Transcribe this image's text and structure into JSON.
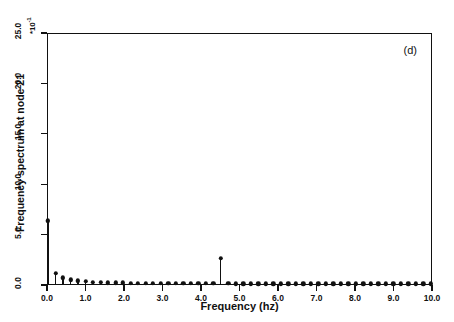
{
  "chart_data": {
    "type": "bar",
    "title": "",
    "panel_label": "(d)",
    "xlabel": "Frequency (hz)",
    "ylabel": "Frequency spectrum at node 21",
    "y_multiplier": "*10",
    "y_multiplier_exponent": "-1",
    "xlim": [
      0.0,
      10.0
    ],
    "ylim": [
      0.0,
      25.0
    ],
    "grid": false,
    "legend": null,
    "xticks": [
      "0.0",
      "1.0",
      "2.0",
      "3.0",
      "4.0",
      "5.0",
      "6.0",
      "7.0",
      "8.0",
      "9.0",
      "10.0"
    ],
    "xtick_values": [
      0.0,
      1.0,
      2.0,
      3.0,
      4.0,
      5.0,
      6.0,
      7.0,
      8.0,
      9.0,
      10.0
    ],
    "yticks": [
      "0.0",
      "5.0",
      "10.0",
      "15.0",
      "20.0",
      "25.0"
    ],
    "ytick_values": [
      0.0,
      5.0,
      10.0,
      15.0,
      20.0,
      25.0
    ],
    "x": [
      0.0,
      0.195,
      0.39,
      0.585,
      0.78,
      0.975,
      1.17,
      1.365,
      1.56,
      1.755,
      1.95,
      2.145,
      2.34,
      2.535,
      2.73,
      2.925,
      3.12,
      3.315,
      3.51,
      3.705,
      3.9,
      4.095,
      4.29,
      4.485,
      4.68,
      4.875,
      5.07,
      5.265,
      5.46,
      5.655,
      5.85,
      6.045,
      6.24,
      6.435,
      6.63,
      6.825,
      7.02,
      7.215,
      7.41,
      7.605,
      7.8,
      7.995,
      8.19,
      8.385,
      8.58,
      8.775,
      8.97,
      9.165,
      9.36,
      9.555,
      9.75,
      9.945
    ],
    "values": [
      6.3,
      1.05,
      0.62,
      0.44,
      0.33,
      0.25,
      0.2,
      0.17,
      0.15,
      0.13,
      0.12,
      0.11,
      0.1,
      0.09,
      0.09,
      0.08,
      0.08,
      0.07,
      0.07,
      0.07,
      0.06,
      0.06,
      0.06,
      2.55,
      0.06,
      0.05,
      0.05,
      0.05,
      0.05,
      0.05,
      0.05,
      0.04,
      0.04,
      0.04,
      0.04,
      0.04,
      0.04,
      0.04,
      0.04,
      0.04,
      0.04,
      0.03,
      0.03,
      0.03,
      0.03,
      0.03,
      0.03,
      0.03,
      0.03,
      0.03,
      0.03,
      0.03
    ],
    "peak_frequency": 4.485,
    "peak_value": 2.55,
    "dc_value": 6.3,
    "marker_color": "#111111",
    "line_color": "#111111"
  }
}
